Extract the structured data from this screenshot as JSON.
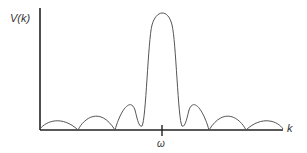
{
  "diagram": {
    "y_axis_label": "V(k)",
    "x_axis_label": "k",
    "tick_label": "ω",
    "colors": {
      "axis": "#222222",
      "curve": "#555555"
    }
  }
}
